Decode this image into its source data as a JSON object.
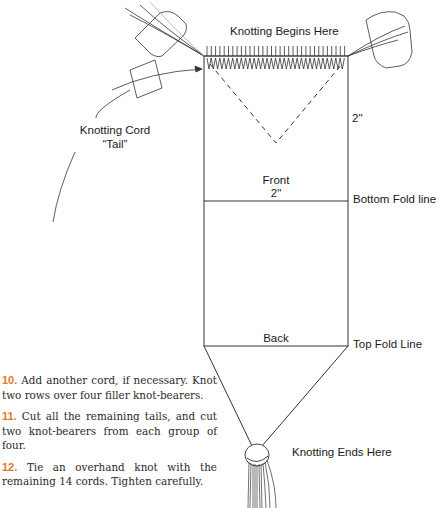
{
  "diagram": {
    "labels": {
      "knotting_begins": "Knotting Begins Here",
      "knotting_cord": "Knotting Cord",
      "tail": "“Tail”",
      "side_measure": "2\"",
      "front": "Front",
      "front_measure": "2\"",
      "bottom_fold": "Bottom Fold line",
      "back": "Back",
      "top_fold": "Top Fold Line",
      "knotting_ends": "Knotting Ends Here"
    },
    "colors": {
      "line": "#333333",
      "step_number": "#e07a1f",
      "text": "#1a1a1a"
    }
  },
  "steps": [
    {
      "number": "10.",
      "text": "Add another cord, if necessary. Knot two rows over four filler knot-bearers."
    },
    {
      "number": "11.",
      "text": "Cut all the remaining tails, and cut two knot-bearers from each group of four."
    },
    {
      "number": "12.",
      "text": "Tie an overhand knot with the remaining 14 cords. Tighten carefully."
    }
  ]
}
